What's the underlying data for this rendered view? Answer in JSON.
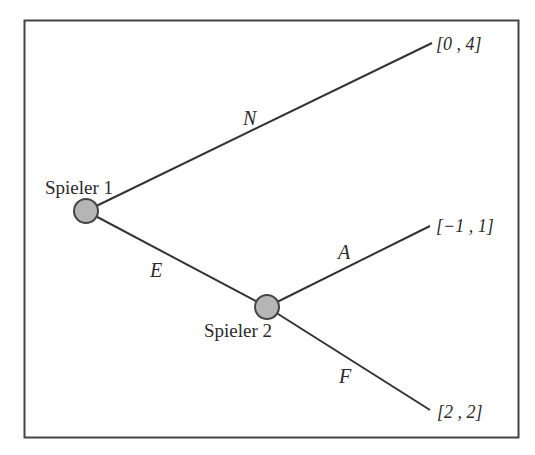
{
  "diagram": {
    "type": "game-tree",
    "colors": {
      "frame": "#444444",
      "line": "#333333",
      "node_fill": "#b5b5b5",
      "node_stroke": "#444444",
      "text": "#2a2a2a"
    },
    "nodes": [
      {
        "id": "p1",
        "label": "Spieler 1"
      },
      {
        "id": "p2",
        "label": "Spieler 2"
      }
    ],
    "edges": [
      {
        "from": "p1",
        "to": "leaf1",
        "label": "N"
      },
      {
        "from": "p1",
        "to": "p2",
        "label": "E"
      },
      {
        "from": "p2",
        "to": "leaf2",
        "label": "A"
      },
      {
        "from": "p2",
        "to": "leaf3",
        "label": "F"
      }
    ],
    "payoffs": [
      {
        "id": "leaf1",
        "label": "[0 , 4]"
      },
      {
        "id": "leaf2",
        "label": "[−1 , 1]"
      },
      {
        "id": "leaf3",
        "label": "[2 , 2]"
      }
    ]
  }
}
